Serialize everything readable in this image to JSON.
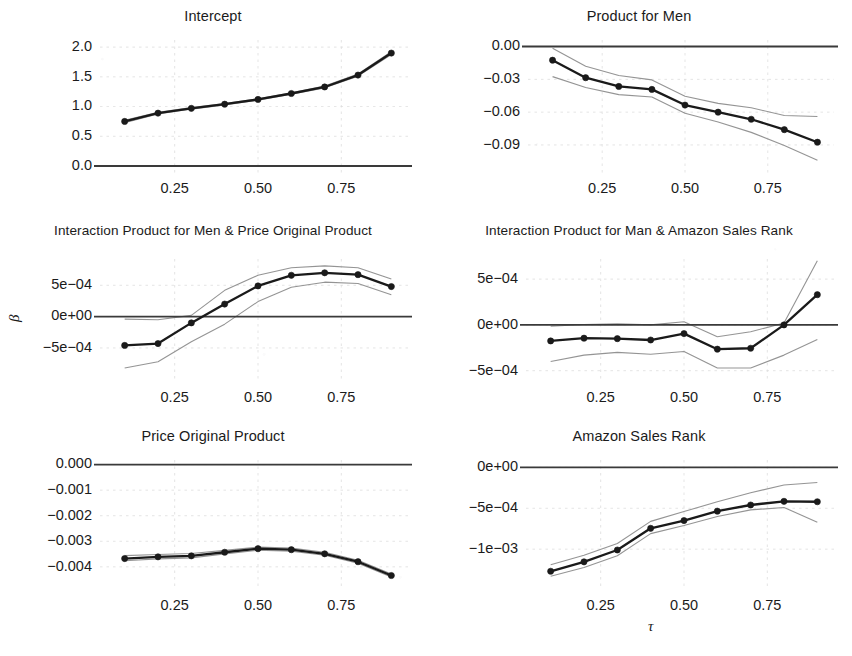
{
  "figure": {
    "ylabel": "β",
    "xlabel": "τ",
    "line_color": "#1a1a1a",
    "band_color": "#8e8e8e",
    "zero_line_color": "#3a3a3a",
    "grid_color": "#d9d9d9",
    "marker_color": "#1a1a1a",
    "background": "#ffffff"
  },
  "chart_data": [
    {
      "type": "line",
      "panel": 1,
      "title": "Intercept",
      "xlabel": "",
      "ylabel": "β",
      "x": [
        0.1,
        0.2,
        0.3,
        0.4,
        0.5,
        0.6,
        0.7,
        0.8,
        0.9
      ],
      "values": [
        0.75,
        0.89,
        0.97,
        1.04,
        1.12,
        1.22,
        1.33,
        1.53,
        1.9
      ],
      "ci_lower": [
        0.73,
        0.875,
        0.958,
        1.028,
        1.108,
        1.208,
        1.315,
        1.512,
        1.875
      ],
      "ci_upper": [
        0.77,
        0.905,
        0.982,
        1.052,
        1.132,
        1.232,
        1.345,
        1.548,
        1.925
      ],
      "xticks": [
        0.25,
        0.5,
        0.75
      ],
      "xticklabels": [
        "0.25",
        "0.50",
        "0.75"
      ],
      "yticks": [
        0.0,
        0.5,
        1.0,
        1.5,
        2.0
      ],
      "yticklabels": [
        "0.0",
        "0.5",
        "1.0",
        "1.5",
        "2.0"
      ],
      "xlim": [
        0.05,
        0.95
      ],
      "ylim": [
        -0.05,
        2.12
      ],
      "zero_line": 0.0,
      "grid": true,
      "legend": "none"
    },
    {
      "type": "line",
      "panel": 2,
      "title": "Product for Men",
      "xlabel": "",
      "ylabel": "",
      "x": [
        0.1,
        0.2,
        0.3,
        0.4,
        0.5,
        0.6,
        0.7,
        0.8,
        0.9
      ],
      "values": [
        -0.0125,
        -0.0285,
        -0.0365,
        -0.0392,
        -0.0535,
        -0.06,
        -0.0665,
        -0.076,
        -0.0875
      ],
      "ci_lower": [
        -0.0275,
        -0.0375,
        -0.044,
        -0.0462,
        -0.061,
        -0.069,
        -0.0785,
        -0.0905,
        -0.104
      ],
      "ci_upper": [
        -0.0015,
        -0.018,
        -0.0265,
        -0.0305,
        -0.0455,
        -0.052,
        -0.056,
        -0.063,
        -0.064
      ],
      "xticks": [
        0.25,
        0.5,
        0.75
      ],
      "xticklabels": [
        "0.25",
        "0.50",
        "0.75"
      ],
      "yticks": [
        0.0,
        -0.03,
        -0.06,
        -0.09
      ],
      "yticklabels": [
        "0.00",
        "−0.03",
        "−0.06",
        "−0.09"
      ],
      "xlim": [
        0.05,
        0.95
      ],
      "ylim": [
        -0.112,
        0.006
      ],
      "zero_line": 0.0,
      "grid": true,
      "legend": "none"
    },
    {
      "type": "line",
      "panel": 3,
      "title": "Interaction Product for Men & Price Original Product",
      "xlabel": "",
      "ylabel": "β",
      "x": [
        0.1,
        0.2,
        0.3,
        0.4,
        0.5,
        0.6,
        0.7,
        0.8,
        0.9
      ],
      "values": [
        -0.00046,
        -0.00043,
        -0.0001,
        0.0002,
        0.00049,
        0.00066,
        0.0007,
        0.00067,
        0.00048
      ],
      "ci_lower": [
        -0.00082,
        -0.00072,
        -0.0004,
        -0.00012,
        0.00024,
        0.00047,
        0.00055,
        0.00053,
        0.00035
      ],
      "ci_upper": [
        -4e-05,
        -5e-05,
        2e-05,
        0.00042,
        0.00066,
        0.00078,
        0.00081,
        0.00078,
        0.0006
      ],
      "xticks": [
        0.25,
        0.5,
        0.75
      ],
      "xticklabels": [
        "0.25",
        "0.50",
        "0.75"
      ],
      "yticks": [
        0.0005,
        0.0,
        -0.0005
      ],
      "yticklabels": [
        "5e−04",
        "0e+00",
        "−5e−04"
      ],
      "xlim": [
        0.05,
        0.95
      ],
      "ylim": [
        -0.00098,
        0.00092
      ],
      "zero_line": 0.0,
      "grid": true,
      "legend": "none"
    },
    {
      "type": "line",
      "panel": 4,
      "title": "Interaction Product for Man & Amazon Sales Rank",
      "xlabel": "",
      "ylabel": "",
      "x": [
        0.1,
        0.2,
        0.3,
        0.4,
        0.5,
        0.6,
        0.7,
        0.8,
        0.9
      ],
      "values": [
        -0.000175,
        -0.000145,
        -0.00015,
        -0.000165,
        -9.5e-05,
        -0.000265,
        -0.000255,
        0.0,
        0.00033
      ],
      "ci_lower": [
        -0.0004,
        -0.00033,
        -0.0003,
        -0.00032,
        -0.00029,
        -0.00047,
        -0.00047,
        -0.00033,
        -0.00016
      ],
      "ci_upper": [
        -1.5e-05,
        5e-06,
        1.2e-05,
        0.0,
        3.5e-05,
        -0.00013,
        -7.5e-05,
        2e-05,
        0.0007
      ],
      "xticks": [
        0.25,
        0.5,
        0.75
      ],
      "xticklabels": [
        "0.25",
        "0.50",
        "0.75"
      ],
      "yticks": [
        0.0005,
        0.0,
        -0.0005
      ],
      "yticklabels": [
        "5e−04",
        "0e+00",
        "−5e−04"
      ],
      "xlim": [
        0.05,
        0.95
      ],
      "ylim": [
        -0.00058,
        0.00072
      ],
      "zero_line": 0.0,
      "grid": true,
      "legend": "none"
    },
    {
      "type": "line",
      "panel": 5,
      "title": "Price Original Product",
      "xlabel": "",
      "ylabel": "β",
      "x": [
        0.1,
        0.2,
        0.3,
        0.4,
        0.5,
        0.6,
        0.7,
        0.8,
        0.9
      ],
      "values": [
        -0.003675,
        -0.00361,
        -0.00357,
        -0.00343,
        -0.00329,
        -0.00333,
        -0.00349,
        -0.0038,
        -0.00434
      ],
      "ci_lower": [
        -0.00376,
        -0.00369,
        -0.00365,
        -0.0035,
        -0.00335,
        -0.00339,
        -0.003545,
        -0.003855,
        -0.004395
      ],
      "ci_upper": [
        -0.00356,
        -0.00352,
        -0.00348,
        -0.003355,
        -0.00323,
        -0.00327,
        -0.00343,
        -0.003745,
        -0.004285
      ],
      "xticks": [
        0.25,
        0.5,
        0.75
      ],
      "xticklabels": [
        "0.25",
        "0.50",
        "0.75"
      ],
      "yticks": [
        0.0,
        -0.001,
        -0.002,
        -0.003,
        -0.004
      ],
      "yticklabels": [
        "0.000",
        "−0.001",
        "−0.002",
        "−0.003",
        "−0.004"
      ],
      "xlim": [
        0.05,
        0.95
      ],
      "ylim": [
        -0.00475,
        0.00018
      ],
      "zero_line": 0.0,
      "grid": true,
      "legend": "none"
    },
    {
      "type": "line",
      "panel": 6,
      "title": "Amazon Sales Rank",
      "xlabel": "τ",
      "ylabel": "",
      "x": [
        0.1,
        0.2,
        0.3,
        0.4,
        0.5,
        0.6,
        0.7,
        0.8,
        0.9
      ],
      "values": [
        -0.00127,
        -0.001155,
        -0.00101,
        -0.000745,
        -0.00065,
        -0.000535,
        -0.00046,
        -0.000415,
        -0.00042
      ],
      "ci_lower": [
        -0.00133,
        -0.001225,
        -0.00108,
        -0.00081,
        -0.00071,
        -0.0006,
        -0.00052,
        -0.00049,
        -0.00067
      ],
      "ci_upper": [
        -0.00119,
        -0.001075,
        -0.00093,
        -0.00066,
        -0.00054,
        -0.00042,
        -0.00031,
        -0.000215,
        -0.000185
      ],
      "xticks": [
        0.25,
        0.5,
        0.75
      ],
      "xticklabels": [
        "0.25",
        "0.50",
        "0.75"
      ],
      "yticks": [
        0.0,
        -0.0005,
        -0.001
      ],
      "yticklabels": [
        "0e+00",
        "−5e−04",
        "−1e−03"
      ],
      "xlim": [
        0.05,
        0.95
      ],
      "ylim": [
        -0.00145,
        9e-05
      ],
      "zero_line": 0.0,
      "grid": true,
      "legend": "none"
    }
  ]
}
